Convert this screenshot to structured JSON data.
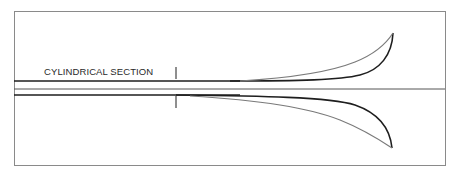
{
  "diagram": {
    "label": "CYLINDRICAL SECTION",
    "colors": {
      "frame": "#8a8a8a",
      "inner_line": "#1e1e1e",
      "outer_line": "#7a7a7a",
      "text": "#2a2a2a",
      "background": "#ffffff"
    },
    "components": {
      "frame": "rectangular border",
      "axis": "horizontal center line",
      "cylinder_walls": "two parallel horizontal lines",
      "section_marker": "vertical tick marking end of cylindrical section",
      "flare_upper": "upper bell flare curves",
      "flare_lower": "lower bell flare curves"
    }
  }
}
